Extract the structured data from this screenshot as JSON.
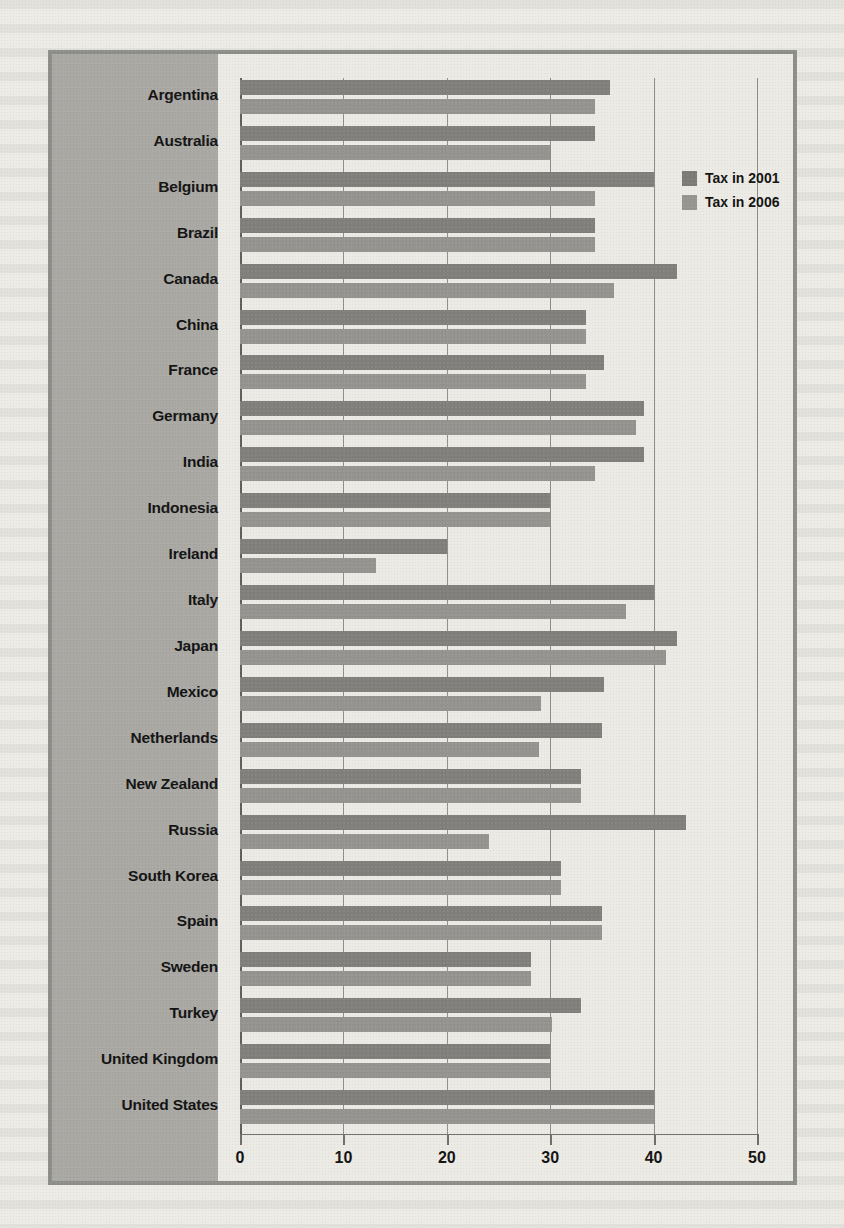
{
  "chart_data": {
    "type": "bar",
    "orientation": "horizontal",
    "title": "",
    "xlabel": "",
    "ylabel": "",
    "xlim": [
      0,
      50
    ],
    "xticks": [
      0,
      10,
      20,
      30,
      40,
      50
    ],
    "xtick_labels": [
      "0",
      "10",
      "20",
      "30",
      "40",
      "50"
    ],
    "grid": true,
    "legend_position": "top-right",
    "categories": [
      "Argentina",
      "Australia",
      "Belgium",
      "Brazil",
      "Canada",
      "China",
      "France",
      "Germany",
      "India",
      "Indonesia",
      "Ireland",
      "Italy",
      "Japan",
      "Mexico",
      "Netherlands",
      "New Zealand",
      "Russia",
      "South Korea",
      "Spain",
      "Sweden",
      "Turkey",
      "United Kingdom",
      "United States"
    ],
    "series": [
      {
        "name": "Tax in 2001",
        "color": "#807f7b",
        "values": [
          35.8,
          34.3,
          40.0,
          34.3,
          42.3,
          33.5,
          35.2,
          39.1,
          39.1,
          30.0,
          20.0,
          40.0,
          42.3,
          35.2,
          35.0,
          33.0,
          43.1,
          31.0,
          35.0,
          28.1,
          33.0,
          30.0,
          40.0
        ]
      },
      {
        "name": "Tax in 2006",
        "color": "#949390",
        "values": [
          34.3,
          30.0,
          34.3,
          34.3,
          36.2,
          33.5,
          33.5,
          38.3,
          34.3,
          30.0,
          13.2,
          37.3,
          41.2,
          29.1,
          28.9,
          33.0,
          24.1,
          31.0,
          35.0,
          28.1,
          30.2,
          30.0,
          40.0
        ]
      }
    ]
  },
  "legend": {
    "items": [
      {
        "label": "Tax in 2001"
      },
      {
        "label": "Tax in 2006"
      }
    ]
  },
  "colors": {
    "series_2001": "#807f7b",
    "series_2006": "#949390",
    "label_panel": "#a9a8a3",
    "plot_background": "#eceae4",
    "frame": "#8d8d8a",
    "grid": "#6f6e6b"
  }
}
